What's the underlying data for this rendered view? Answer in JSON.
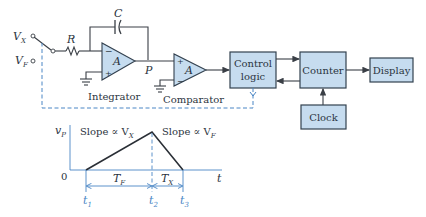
{
  "inputs": {
    "vx": "V",
    "vx_sub": "X",
    "vf": "V",
    "vf_sub": "F"
  },
  "components": {
    "resistor": "R",
    "capacitor": "C",
    "integrator_amp": "A",
    "comparator_amp": "A",
    "node_p": "P",
    "minus": "−",
    "plus": "+"
  },
  "labels": {
    "integrator": "Integrator",
    "comparator": "Comparator"
  },
  "blocks": {
    "control_logic_line1": "Control",
    "control_logic_line2": "logic",
    "counter": "Counter",
    "display": "Display",
    "clock": "Clock"
  },
  "waveform": {
    "y_axis": "v",
    "y_axis_sub": "P",
    "origin": "0",
    "x_axis": "t",
    "slope1": "Slope ∝ V",
    "slope1_sub": "X",
    "slope2": "Slope ∝ V",
    "slope2_sub": "F",
    "tf": "T",
    "tf_sub": "F",
    "tx": "T",
    "tx_sub": "X",
    "t1": "t",
    "t1_sub": "1",
    "t2": "t",
    "t2_sub": "2",
    "t3": "t",
    "t3_sub": "3"
  },
  "colors": {
    "block_fill": "#c6dcef",
    "control_line": "#4a86c5",
    "ink": "#2b3440"
  }
}
